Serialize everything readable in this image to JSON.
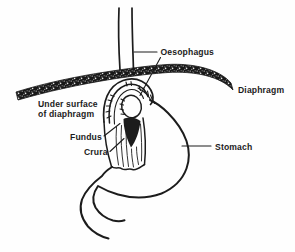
{
  "figure": {
    "colors": {
      "ink": "#1c1c1c",
      "background": "#fefefe",
      "diaphragm_fill": "#181818",
      "diaphragm_speckle": "#d9d9d9"
    },
    "labels": {
      "oesophagus": "Oesophagus",
      "diaphragm": "Diaphragm",
      "under_surface": [
        "Under surface",
        "of diaphragm"
      ],
      "fundus": "Fundus",
      "crura": "Crura",
      "stomach": "Stomach"
    }
  }
}
